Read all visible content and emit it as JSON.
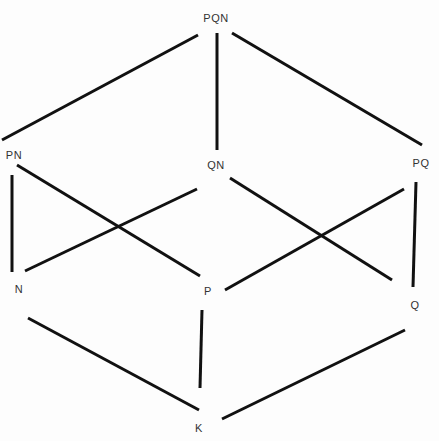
{
  "diagram": {
    "type": "hasse-diagram",
    "nodes": [
      {
        "id": "PQN",
        "label": "PQN",
        "x": 216,
        "y": 18
      },
      {
        "id": "PN",
        "label": "PN",
        "x": 14,
        "y": 155
      },
      {
        "id": "QN",
        "label": "QN",
        "x": 216,
        "y": 165
      },
      {
        "id": "PQ",
        "label": "PQ",
        "x": 421,
        "y": 163
      },
      {
        "id": "N",
        "label": "N",
        "x": 19,
        "y": 289
      },
      {
        "id": "P",
        "label": "P",
        "x": 208,
        "y": 291
      },
      {
        "id": "Q",
        "label": "Q",
        "x": 415,
        "y": 305
      },
      {
        "id": "K",
        "label": "K",
        "x": 199,
        "y": 428
      }
    ],
    "edges": [
      {
        "from": "PQN",
        "to": "PN",
        "x1": 198,
        "y1": 35,
        "x2": 2,
        "y2": 140
      },
      {
        "from": "PQN",
        "to": "QN",
        "x1": 217,
        "y1": 33,
        "x2": 217,
        "y2": 150
      },
      {
        "from": "PQN",
        "to": "PQ",
        "x1": 232,
        "y1": 33,
        "x2": 422,
        "y2": 145
      },
      {
        "from": "PN",
        "to": "N",
        "x1": 12,
        "y1": 175,
        "x2": 12,
        "y2": 272
      },
      {
        "from": "PN",
        "to": "P",
        "x1": 17,
        "y1": 165,
        "x2": 200,
        "y2": 276
      },
      {
        "from": "QN",
        "to": "N",
        "x1": 197,
        "y1": 189,
        "x2": 25,
        "y2": 271
      },
      {
        "from": "QN",
        "to": "Q",
        "x1": 230,
        "y1": 178,
        "x2": 392,
        "y2": 280
      },
      {
        "from": "PQ",
        "to": "P",
        "x1": 404,
        "y1": 189,
        "x2": 225,
        "y2": 290
      },
      {
        "from": "PQ",
        "to": "Q",
        "x1": 416,
        "y1": 182,
        "x2": 413,
        "y2": 287
      },
      {
        "from": "N",
        "to": "K",
        "x1": 28,
        "y1": 318,
        "x2": 199,
        "y2": 410
      },
      {
        "from": "P",
        "to": "K",
        "x1": 202,
        "y1": 310,
        "x2": 200,
        "y2": 388
      },
      {
        "from": "Q",
        "to": "K",
        "x1": 405,
        "y1": 330,
        "x2": 222,
        "y2": 419
      }
    ],
    "colors": {
      "line": "#111111",
      "label": "#333333",
      "background": "#fdfdfd"
    }
  }
}
